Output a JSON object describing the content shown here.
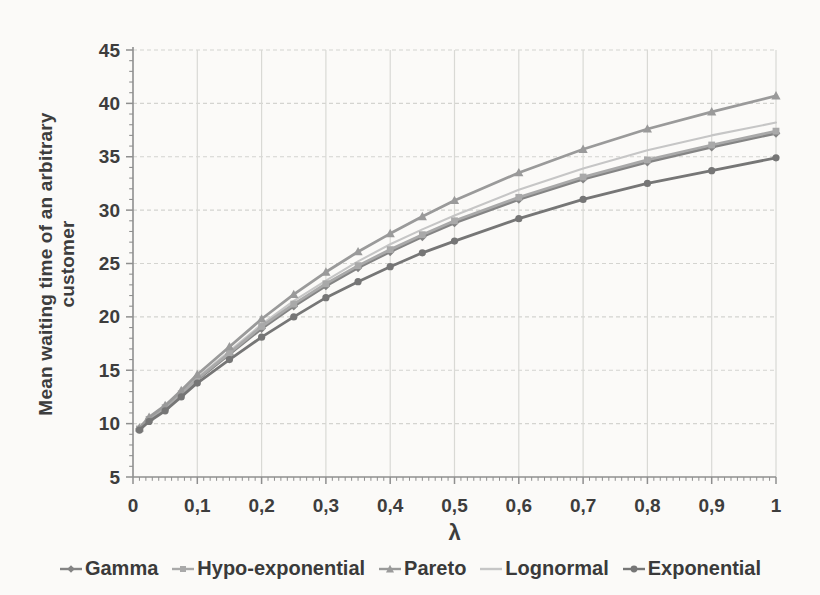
{
  "chart_data": {
    "type": "line",
    "title": "",
    "xlabel": "λ",
    "ylabel": "Mean waiting time of an arbitrary customer",
    "ylabel_lines": [
      "Mean waiting time of an arbitrary",
      "customer"
    ],
    "xlim": [
      0,
      1
    ],
    "ylim": [
      5,
      45
    ],
    "y_ticks": [
      5,
      10,
      15,
      20,
      25,
      30,
      35,
      40,
      45
    ],
    "y_minor_step": 1,
    "x_ticks": [
      0,
      0.1,
      0.2,
      0.3,
      0.4,
      0.5,
      0.6,
      0.7,
      0.8,
      0.9,
      1
    ],
    "x_tick_labels": [
      "0",
      "0,1",
      "0,2",
      "0,3",
      "0,4",
      "0,5",
      "0,6",
      "0,7",
      "0,8",
      "0,9",
      "1"
    ],
    "x_minor_step": 0.01,
    "decimal_separator": ",",
    "grid": true,
    "legend_position": "bottom",
    "x": [
      0.01,
      0.025,
      0.05,
      0.075,
      0.1,
      0.15,
      0.2,
      0.25,
      0.3,
      0.35,
      0.4,
      0.45,
      0.5,
      0.6,
      0.7,
      0.8,
      0.9,
      1
    ],
    "series": [
      {
        "name": "Gamma",
        "color": "#848484",
        "marker": "diamond",
        "values": [
          9.5,
          10.4,
          11.4,
          12.7,
          14.1,
          16.5,
          18.9,
          21.0,
          22.9,
          24.6,
          26.1,
          27.5,
          28.8,
          31.0,
          32.9,
          34.5,
          35.9,
          37.2
        ]
      },
      {
        "name": "Hypo-exponential",
        "color": "#a9a9a9",
        "marker": "square",
        "values": [
          9.5,
          10.4,
          11.5,
          12.8,
          14.2,
          16.6,
          19.1,
          21.2,
          23.1,
          24.8,
          26.3,
          27.7,
          29.0,
          31.2,
          33.1,
          34.7,
          36.1,
          37.4
        ]
      },
      {
        "name": "Pareto",
        "color": "#9a9a9a",
        "marker": "triangle",
        "values": [
          9.6,
          10.6,
          11.7,
          13.1,
          14.6,
          17.2,
          19.8,
          22.1,
          24.2,
          26.1,
          27.8,
          29.4,
          30.9,
          33.5,
          35.7,
          37.6,
          39.2,
          40.7
        ]
      },
      {
        "name": "Lognormal",
        "color": "#c6c6c6",
        "marker": "none",
        "values": [
          9.6,
          10.5,
          11.6,
          12.9,
          14.3,
          16.8,
          19.3,
          21.5,
          23.4,
          25.2,
          26.8,
          28.2,
          29.5,
          31.9,
          33.9,
          35.6,
          37.0,
          38.2
        ]
      },
      {
        "name": "Exponential",
        "color": "#767676",
        "marker": "circle",
        "values": [
          9.4,
          10.2,
          11.2,
          12.5,
          13.8,
          16.0,
          18.1,
          20.0,
          21.8,
          23.3,
          24.7,
          26.0,
          27.1,
          29.2,
          31.0,
          32.5,
          33.7,
          34.9
        ]
      }
    ]
  },
  "style": {
    "background": "#fbfaf8",
    "text_color": "#3d3d3d",
    "grid_color_h": "#d4d4d0",
    "grid_color_v": "#d9d9d5",
    "axis_color": "#8f8f8f"
  }
}
